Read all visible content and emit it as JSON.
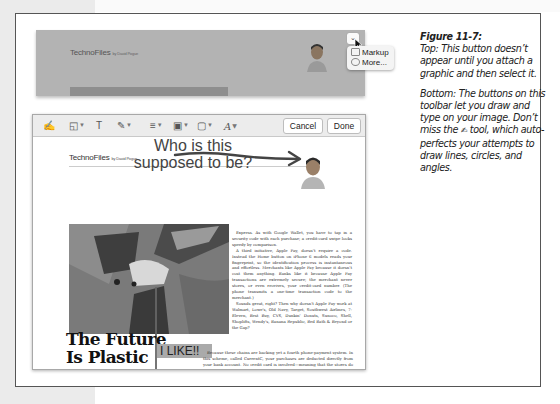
{
  "figure": {
    "number": "Figure 11-7:",
    "caption_top": "Top: This button doesn’t appear until you attach a graphic and then select it.",
    "caption_bottom_pre": "Bottom: The buttons on this toolbar let you draw and type on your image. Don’t miss the",
    "caption_bottom_post": "tool, which auto-perfects your attempts to draw lines, circles, and angles."
  },
  "top_screenshot": {
    "masthead": "TechnoFiles",
    "byline": "by David Pogue",
    "menu_button": "⌄",
    "menu_items": [
      {
        "icon": "markup-icon",
        "label": "Markup"
      },
      {
        "icon": "more-icon",
        "label": "More..."
      }
    ]
  },
  "markup_window": {
    "toolbar": {
      "tools": [
        {
          "name": "sketch-tool",
          "glyph": "✍"
        },
        {
          "name": "shapes-tool",
          "glyph": "◱"
        },
        {
          "name": "text-tool",
          "glyph": "T"
        },
        {
          "name": "sign-tool",
          "glyph": "✎"
        },
        {
          "name": "line-style-tool",
          "glyph": "≡"
        },
        {
          "name": "border-color-tool",
          "glyph": "▣"
        },
        {
          "name": "fill-color-tool",
          "glyph": "▢"
        },
        {
          "name": "text-style-tool",
          "glyph": "A"
        }
      ],
      "cancel_label": "Cancel",
      "done_label": "Done"
    },
    "document": {
      "masthead": "TechnoFiles",
      "byline": "by David Pogue",
      "annotation_line1": "Who is this",
      "annotation_line2": "supposed to be?",
      "headline_line1": "The Future",
      "headline_line2": "Is Plastic",
      "callout": "I LIKE!!",
      "body_col": [
        "Express. As with Google Wallet, you have to tap in a security code with each purchase; a credit-card swipe looks speedy by comparison.",
        "A third initiative, Apple Pay, doesn't require a code. Instead the Home button on iPhone 6 models reads your fingerprint, so the identification process is instantaneous and effortless. Merchants like Apple Pay because it doesn't cost them anything. Banks like it because Apple Pay transactions are extremely secure; the merchant never stores, or even receives, your credit-card number. (The phone transmits a one-time transaction code to the merchant.)",
        "Sounds great, right? Then why doesn't Apple Pay work at Walmart, Lowe's, Old Navy, Target, Southwest Airlines, 7-Eleven, Best Buy, CVS, Dunkin' Donuts, Sunoco, Shell, Shoplifts, Wendy's, Banana Republic, Bed Bath & Beyond or the Gap?"
      ],
      "body_wide": "Because these chains are backing yet a fourth phone-payment system. In this scheme, called CurrentC, your purchases are deducted directly from your bank account. No credit card is involved—meaning that the stores do not have to pay the banks the usual 2 to 4 percent card fees on each sale. For a national"
    }
  }
}
